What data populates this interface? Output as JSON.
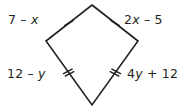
{
  "figure": {
    "type": "kite-quadrilateral-diagram",
    "shape_name": "kite",
    "stroke_color": "#231f20",
    "background_color": "#ffffff",
    "text_color": "#231f20",
    "vertices": {
      "top": {
        "x": 92,
        "y": 5
      },
      "left": {
        "x": 46,
        "y": 41
      },
      "right": {
        "x": 138,
        "y": 41
      },
      "bottom": {
        "x": 92,
        "y": 105
      }
    },
    "labels": {
      "top_left": "7 – x",
      "top_right": "2x – 5",
      "bottom_left": "12 – y",
      "bottom_right": "4y + 12"
    },
    "label_parts": {
      "top_left": {
        "pre": "7 – ",
        "var": "x",
        "post": ""
      },
      "top_right": {
        "pre": "2",
        "var": "x",
        "post": " – 5"
      },
      "bottom_left": {
        "pre": "12 – ",
        "var": "y",
        "post": ""
      },
      "bottom_right": {
        "pre": "4",
        "var": "y",
        "post": " + 12"
      }
    },
    "congruence_marks": {
      "top_left_side": {
        "ticks": 1,
        "for_label": "7 – x"
      },
      "top_right_side": {
        "ticks": 1,
        "for_label": "2x – 5"
      },
      "bottom_left_side": {
        "ticks": 2,
        "for_label": "12 – y"
      },
      "bottom_right_side": {
        "ticks": 2,
        "for_label": "4y + 12"
      }
    }
  }
}
